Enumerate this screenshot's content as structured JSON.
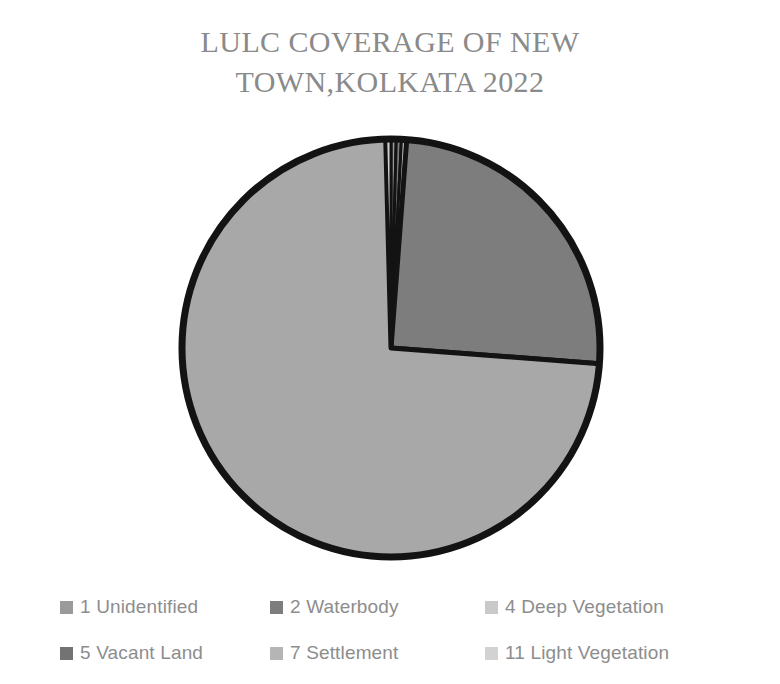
{
  "title": "LULC COVERAGE OF NEW\nTOWN,KOLKATA 2022",
  "legend": {
    "items": [
      {
        "label": "1 Unidentified",
        "color": "#9a9a9a"
      },
      {
        "label": "2 Waterbody",
        "color": "#7d7d7d"
      },
      {
        "label": "4 Deep Vegetation",
        "color": "#c9c9c9"
      },
      {
        "label": "5 Vacant Land",
        "color": "#737373"
      },
      {
        "label": "7 Settlement",
        "color": "#b5b5b5"
      },
      {
        "label": "11 Light Vegetation",
        "color": "#d2d2d2"
      }
    ]
  },
  "colors": {
    "title_text": "#8a8a8a",
    "legend_text": "#8d8d8d",
    "outline": "#131313",
    "background": "#ffffff"
  },
  "chart_data": {
    "type": "pie",
    "title": "LULC COVERAGE OF NEW TOWN,KOLKATA 2022",
    "labels": [
      "1 Unidentified",
      "2 Waterbody",
      "4 Deep Vegetation",
      "5 Vacant Land",
      "7 Settlement",
      "11 Light Vegetation"
    ],
    "values": [
      0.4,
      0.4,
      0.4,
      25.0,
      73.4,
      0.4
    ],
    "colors": [
      "#9a9a9a",
      "#7d7d7d",
      "#c9c9c9",
      "#7d7d7d",
      "#a8a8a8",
      "#d2d2d2"
    ],
    "legend_position": "bottom",
    "start_angle": 0,
    "direction": "clockwise",
    "labels_shown": false,
    "grid": false
  }
}
